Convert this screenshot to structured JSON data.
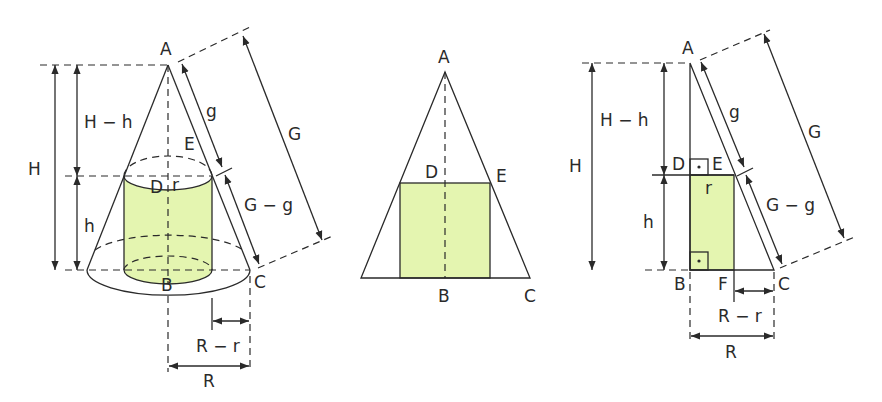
{
  "colors": {
    "fill": "#e4f5b0",
    "line": "#2a2a2a",
    "background": "#ffffff"
  },
  "figure_left": {
    "title": "Cone with inscribed cylinder (3D)",
    "points": {
      "A": "A",
      "B": "B",
      "C": "C",
      "D": "D",
      "E": "E"
    },
    "labels": {
      "H": "H",
      "H_minus_h": "H − h",
      "h": "h",
      "g": "g",
      "G": "G",
      "G_minus_g": "G − g",
      "r": "r",
      "R": "R",
      "R_minus_r": "R − r"
    }
  },
  "figure_middle": {
    "title": "Axial cross-section",
    "points": {
      "A": "A",
      "B": "B",
      "C": "C",
      "D": "D",
      "E": "E"
    }
  },
  "figure_right": {
    "title": "Half cross-section with right angles",
    "points": {
      "A": "A",
      "B": "B",
      "C": "C",
      "D": "D",
      "E": "E",
      "F": "F"
    },
    "labels": {
      "H": "H",
      "H_minus_h": "H − h",
      "h": "h",
      "g": "g",
      "G": "G",
      "G_minus_g": "G − g",
      "r": "r",
      "R": "R",
      "R_minus_r": "R − r"
    }
  }
}
